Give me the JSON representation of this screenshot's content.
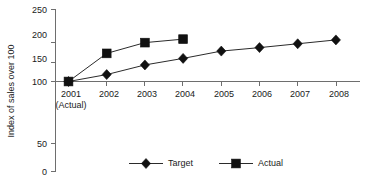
{
  "chart_data": {
    "type": "line",
    "title": "",
    "xlabel": "",
    "ylabel": "Index of sales over 100",
    "ylim": [
      0,
      250
    ],
    "grid": false,
    "legend_position": "bottom",
    "categories": [
      "2001\n(Actual)",
      "2002",
      "2003",
      "2004",
      "2005",
      "2006",
      "2007",
      "2008"
    ],
    "x_tick_labels": [
      "2001",
      "2002",
      "2003",
      "2004",
      "2005",
      "2006",
      "2007",
      "2008"
    ],
    "x_tick_sublabels": [
      "(Actual)",
      "",
      "",
      "",
      "",
      "",
      "",
      ""
    ],
    "y_tick_labels": [
      "0",
      "50",
      "100",
      "150",
      "200",
      "250"
    ],
    "y_ticks": [
      0,
      50,
      100,
      150,
      200,
      250
    ],
    "series": [
      {
        "name": "Target",
        "marker": "diamond",
        "color": "#111111",
        "x": [
          "2001",
          "2002",
          "2003",
          "2004",
          "2005",
          "2006",
          "2007",
          "2008"
        ],
        "values": [
          100,
          118,
          143,
          160,
          179,
          188,
          198,
          208
        ]
      },
      {
        "name": "Actual",
        "marker": "square",
        "color": "#111111",
        "x": [
          "2001",
          "2002",
          "2003",
          "2004"
        ],
        "values": [
          100,
          173,
          201,
          210
        ]
      }
    ],
    "legend": [
      {
        "label": "Target",
        "marker": "diamond"
      },
      {
        "label": "Actual",
        "marker": "square"
      }
    ]
  }
}
